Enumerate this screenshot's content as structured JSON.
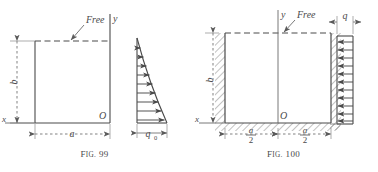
{
  "page": {
    "background": "#ffffff",
    "ink": "#3a3a3a",
    "width": 378,
    "height": 172
  },
  "figures": [
    {
      "id": "fig-99",
      "caption_prefix": "F",
      "caption_small": "IG.",
      "caption_number": "99",
      "caption_full": "Fig. 99",
      "plate": {
        "free_edge_label": "Free",
        "free_edge_style": "dashed",
        "supports": "none-drawn",
        "width_label": "a",
        "height_label": "b",
        "origin_label": "O",
        "origin_position": "bottom-right",
        "axis_vertical_label": "y",
        "axis_horizontal_label": "x"
      },
      "load": {
        "type": "triangular",
        "magnitude_label": "q",
        "magnitude_subscript": "0",
        "magnitude_label_full": "q0",
        "direction": "right",
        "arrow_count": 9,
        "max_at": "bottom",
        "min_at": "top"
      }
    },
    {
      "id": "fig-100",
      "caption_prefix": "F",
      "caption_small": "IG.",
      "caption_number": "100",
      "caption_full": "Fig. 100",
      "plate": {
        "free_edge_label": "Free",
        "free_edge_style": "dashed",
        "supports": "hatched-fixed-left-right-bottom",
        "height_label": "b",
        "half_width_numerator": "a",
        "half_width_denominator": "2",
        "half_width_label": "a/2",
        "origin_label": "O",
        "origin_position": "bottom-center",
        "axis_vertical_label": "y",
        "axis_horizontal_label": "x"
      },
      "load": {
        "type": "uniform",
        "magnitude_label": "q",
        "direction": "left",
        "arrow_count": 11,
        "max_at": "uniform",
        "min_at": "uniform"
      }
    }
  ]
}
